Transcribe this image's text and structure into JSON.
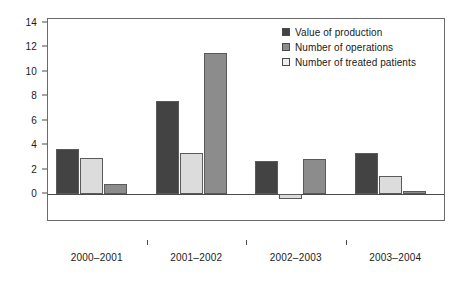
{
  "chart_data": {
    "type": "bar",
    "title": "",
    "subtitle": "",
    "xlabel": "",
    "ylabel": "",
    "categories": [
      "2000–2001",
      "2001–2002",
      "2002–2003",
      "2003–2004"
    ],
    "series": [
      {
        "name": "Value of production",
        "color": "#434343",
        "values": [
          3.7,
          7.6,
          2.7,
          3.35
        ]
      },
      {
        "name": "Number of operations",
        "color": "#8c8c8c",
        "values": [
          0.8,
          11.55,
          2.9,
          0.25
        ]
      },
      {
        "name": "Number of treated patients",
        "color": "#dcdcdc",
        "values": [
          2.95,
          3.35,
          -0.45,
          1.5
        ]
      }
    ],
    "series_draw_order": [
      "Value of production",
      "Number of treated patients",
      "Number of operations"
    ],
    "ylim": [
      -1,
      14
    ],
    "yticks": [
      0,
      2,
      4,
      6,
      8,
      10,
      12,
      14
    ],
    "ytick_labels": [
      "0",
      "2",
      "4",
      "6",
      "8",
      "10",
      "12",
      "14"
    ],
    "grid": false,
    "legend_position": "top-right",
    "axis_color": "#4a4a4a",
    "background": "#ffffff"
  },
  "legend": {
    "entries": [
      {
        "label": "Value of production",
        "color": "#434343"
      },
      {
        "label": "Number of operations",
        "color": "#8c8c8c"
      },
      {
        "label": "Number of treated patients",
        "color": "#eeeeee"
      }
    ]
  }
}
